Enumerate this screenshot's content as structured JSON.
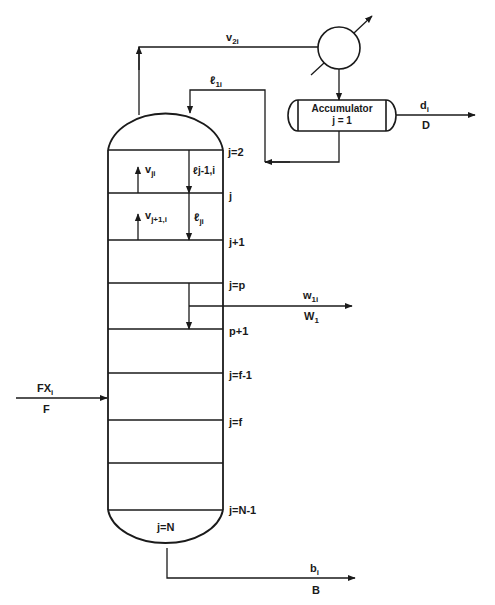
{
  "diagram": {
    "type": "distillation-column-schematic",
    "colors": {
      "line": "#1a1a1a",
      "background": "#ffffff"
    },
    "condenser": {
      "label": ""
    },
    "accumulator": {
      "label": "Accumulator",
      "stage": "j = 1"
    },
    "streams": {
      "vapor_overhead": {
        "label": "v",
        "sub": "2i"
      },
      "reflux": {
        "label": "ℓ",
        "sub": "1i"
      },
      "distillate": {
        "label": "d",
        "sub": "i",
        "total": "D"
      },
      "sidestream": {
        "label": "w",
        "sub": "1i",
        "total": "W",
        "total_sub": "1"
      },
      "feed": {
        "label": "FX",
        "sub": "i",
        "total": "F"
      },
      "bottoms": {
        "label": "b",
        "sub": "i",
        "total": "B"
      },
      "vapor_j": {
        "label": "v",
        "sub": "ji"
      },
      "vapor_j1": {
        "label": "v",
        "sub": "j+1,i"
      },
      "liquid_jm1": {
        "label": "ℓ",
        "sub": "j-1,i"
      },
      "liquid_j": {
        "label": "ℓ",
        "sub": "ji"
      }
    },
    "stage_labels": [
      "j=2",
      "j",
      "j+1",
      "j=p",
      "p+1",
      "j=f-1",
      "j=f",
      "j=N-1"
    ],
    "reboiler_label": "j=N"
  }
}
